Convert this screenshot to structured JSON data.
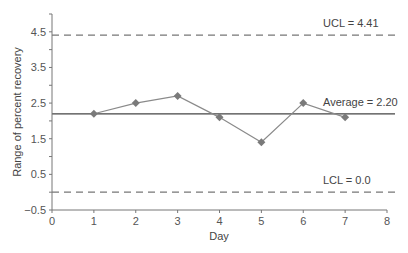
{
  "chart_data": {
    "type": "line",
    "title": "",
    "xlabel": "Day",
    "ylabel": "Range of percent recovery",
    "x": [
      1,
      2,
      3,
      4,
      5,
      6,
      7
    ],
    "series": [
      {
        "name": "Range",
        "values": [
          2.2,
          2.5,
          2.7,
          2.1,
          1.4,
          2.5,
          2.1
        ],
        "marker": "diamond",
        "color": "#7a7a7a"
      }
    ],
    "reference_lines": [
      {
        "name": "UCL",
        "label": "UCL = 4.41",
        "value": 4.41,
        "style": "dashed",
        "color": "#777777"
      },
      {
        "name": "Average",
        "label": "Average = 2.20",
        "value": 2.2,
        "style": "solid",
        "color": "#444444"
      },
      {
        "name": "LCL",
        "label": "LCL = 0.0",
        "value": 0.0,
        "style": "dashed",
        "color": "#777777"
      }
    ],
    "xlim": [
      0,
      8
    ],
    "ylim": [
      -0.5,
      5.0
    ],
    "xticks": [
      "0",
      "1",
      "2",
      "3",
      "4",
      "5",
      "6",
      "7",
      "8"
    ],
    "yticks": [
      "4.5",
      "3.5",
      "2.5",
      "1.5",
      "0.5",
      "−0.5"
    ],
    "ytick_values": [
      4.5,
      3.5,
      2.5,
      1.5,
      0.5,
      -0.5
    ],
    "grid": false,
    "legend": "none"
  }
}
